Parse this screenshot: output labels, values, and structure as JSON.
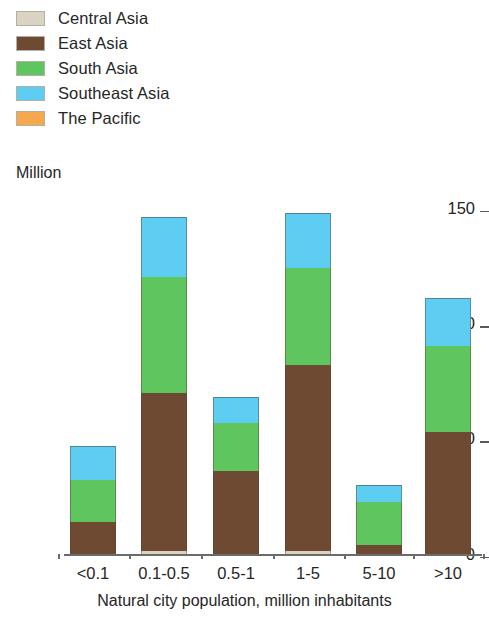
{
  "legend": {
    "items": [
      {
        "label": "Central Asia",
        "color": "#dad3c2",
        "key": "central_asia"
      },
      {
        "label": "East Asia",
        "color": "#6d4a31",
        "key": "east_asia"
      },
      {
        "label": "South Asia",
        "color": "#5fc55f",
        "key": "south_asia"
      },
      {
        "label": "Southeast Asia",
        "color": "#5ecdf2",
        "key": "southeast_asia"
      },
      {
        "label": "The Pacific",
        "color": "#f5a84d",
        "key": "the_pacific"
      }
    ]
  },
  "axes": {
    "y_unit_label": "Million",
    "y_ticks": [
      "0",
      "50",
      "100",
      "150"
    ],
    "x_title": "Natural city population, million inhabitants"
  },
  "chart_data": {
    "type": "bar",
    "subtype": "stacked",
    "title": "",
    "xlabel": "Natural city population, million inhabitants",
    "ylabel": "Million",
    "ylim": [
      0,
      150
    ],
    "yticks": [
      0,
      50,
      100,
      150
    ],
    "grid": false,
    "legend_position": "top-left",
    "categories": [
      "<0.1",
      "0.1-0.5",
      "0.5-1",
      "1-5",
      "5-10",
      ">10"
    ],
    "series": [
      {
        "name": "Central Asia",
        "color": "#dad3c2",
        "values": [
          0,
          1.5,
          0,
          1.5,
          0,
          0
        ]
      },
      {
        "name": "East Asia",
        "color": "#6d4a31",
        "values": [
          14,
          68.5,
          36,
          80.5,
          4,
          53
        ]
      },
      {
        "name": "South Asia",
        "color": "#5fc55f",
        "values": [
          18,
          50,
          21,
          42,
          18.5,
          37
        ]
      },
      {
        "name": "Southeast Asia",
        "color": "#5ecdf2",
        "values": [
          15,
          26,
          11,
          24,
          7.5,
          21
        ]
      },
      {
        "name": "The Pacific",
        "color": "#f5a84d",
        "values": [
          0,
          0,
          0,
          0,
          0,
          0
        ]
      }
    ],
    "totals": [
      47,
      146,
      68,
      148,
      30,
      111
    ]
  },
  "layout": {
    "plot_left": 70,
    "plot_right": 470,
    "baseline_y": 554,
    "y_top_value_y": 208,
    "bar_width": 46,
    "bar_centers": [
      93,
      164,
      236,
      308,
      379,
      448
    ]
  }
}
